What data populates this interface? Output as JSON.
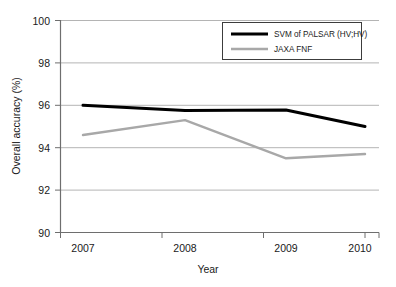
{
  "chart_data": {
    "type": "line",
    "title": "",
    "xlabel": "Year",
    "ylabel": "Overall accuracy (%)",
    "categories": [
      "2007",
      "2008",
      "2009",
      "2010"
    ],
    "x": [
      2007,
      2008,
      2009,
      2010
    ],
    "xlim": [
      2006.6,
      2010.6
    ],
    "ylim": [
      90,
      100
    ],
    "yticks": [
      "90",
      "92",
      "94",
      "96",
      "98",
      "100"
    ],
    "ytick_values": [
      90,
      92,
      94,
      96,
      98,
      100
    ],
    "grid": "horizontal",
    "legend_position": "upper-right",
    "series": [
      {
        "name": "SVM of PALSAR (HV;HV)",
        "values": [
          96.0,
          95.75,
          95.78,
          95.0
        ],
        "color": "#000000",
        "width": 3.0
      },
      {
        "name": "JAXA FNF",
        "values": [
          94.6,
          95.3,
          93.5,
          93.7
        ],
        "color": "#a8a8a8",
        "width": 2.4
      }
    ]
  },
  "axes": {
    "y_title": "Overall accuracy (%)",
    "x_title": "Year",
    "y_tick_0": "90",
    "y_tick_1": "92",
    "y_tick_2": "94",
    "y_tick_3": "96",
    "y_tick_4": "98",
    "y_tick_5": "100",
    "x_tick_0": "2007",
    "x_tick_1": "2008",
    "x_tick_2": "2009",
    "x_tick_3": "2010"
  },
  "legend": {
    "entry_0_label": "SVM of PALSAR (HV;HV)",
    "entry_1_label": "JAXA FNF"
  },
  "colors": {
    "series_black": "#000000",
    "series_gray": "#a8a8a8",
    "gridline": "#b4b4b4",
    "axis": "#6e6e6e",
    "text": "#1a1a1a",
    "background": "#ffffff"
  }
}
